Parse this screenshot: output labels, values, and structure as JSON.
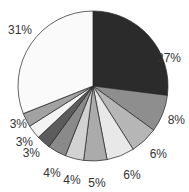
{
  "chart_data": {
    "type": "pie",
    "title": "",
    "start_angle_deg": 0,
    "direction": "clockwise",
    "slices": [
      {
        "label": "27%",
        "value": 27,
        "color": "#2b2b2b"
      },
      {
        "label": "8%",
        "value": 8,
        "color": "#8e8e8e"
      },
      {
        "label": "6%",
        "value": 6,
        "color": "#b6b6b6"
      },
      {
        "label": "6%",
        "value": 6,
        "color": "#e8e8e8"
      },
      {
        "label": "5%",
        "value": 5,
        "color": "#ababab"
      },
      {
        "label": "4%",
        "value": 4,
        "color": "#d2d2d2"
      },
      {
        "label": "4%",
        "value": 4,
        "color": "#8a8a8a"
      },
      {
        "label": "3%",
        "value": 3,
        "color": "#5c5c5c"
      },
      {
        "label": "3%",
        "value": 3,
        "color": "#f3f3f3"
      },
      {
        "label": "3%",
        "value": 3,
        "color": "#a2a2a2"
      },
      {
        "label": "31%",
        "value": 31,
        "color": "#fafafa"
      }
    ],
    "values": [
      27,
      8,
      6,
      6,
      5,
      4,
      4,
      3,
      3,
      3,
      31
    ],
    "categories": [
      "27%",
      "8%",
      "6%",
      "6%",
      "5%",
      "4%",
      "4%",
      "3%",
      "3%",
      "3%",
      "31%"
    ],
    "legend": "none",
    "outline_color": "#222222"
  }
}
